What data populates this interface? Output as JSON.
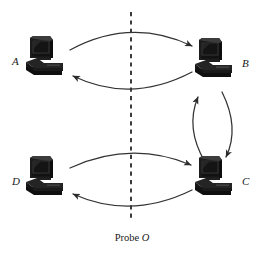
{
  "figure": {
    "caption_prefix": "Probe",
    "caption_symbol": "O",
    "width": 264,
    "height": 255,
    "background_color": "#ffffff",
    "ink_color": "#1a1a1a"
  },
  "nodes": [
    {
      "id": "A",
      "label": "A",
      "icon": "computer-workstation-icon",
      "position": "top-left",
      "label_side": "left",
      "x": 45,
      "y": 57
    },
    {
      "id": "B",
      "label": "B",
      "icon": "computer-workstation-icon",
      "position": "top-right",
      "label_side": "right",
      "x": 214,
      "y": 59
    },
    {
      "id": "C",
      "label": "C",
      "icon": "computer-workstation-icon",
      "position": "bottom-right",
      "label_side": "right",
      "x": 214,
      "y": 177
    },
    {
      "id": "D",
      "label": "D",
      "icon": "computer-workstation-icon",
      "position": "bottom-left",
      "label_side": "left",
      "x": 45,
      "y": 177
    }
  ],
  "divider": {
    "name": "vertical-dashed-divider",
    "orientation": "vertical",
    "x": 131,
    "y_start": 12,
    "y_end": 222,
    "style": "dashed",
    "dash": "4 4",
    "color": "#1a1a1a",
    "width": 1.6
  },
  "arrows": [
    {
      "id": "a-to-b",
      "from": "A",
      "to": "B",
      "curve": "arc-up",
      "crosses_divider": true
    },
    {
      "id": "b-to-a",
      "from": "B",
      "to": "A",
      "curve": "arc-down",
      "crosses_divider": true
    },
    {
      "id": "d-to-c",
      "from": "D",
      "to": "C",
      "curve": "arc-up",
      "crosses_divider": true
    },
    {
      "id": "c-to-d",
      "from": "C",
      "to": "D",
      "curve": "arc-down",
      "crosses_divider": true
    },
    {
      "id": "c-to-b",
      "from": "C",
      "to": "B",
      "curve": "arc-left",
      "crosses_divider": false
    },
    {
      "id": "b-to-c",
      "from": "B",
      "to": "C",
      "curve": "arc-right",
      "crosses_divider": false
    }
  ],
  "colors": {
    "ink": "#1a1a1a",
    "stroke": "#333333",
    "monitor_body": "#1c1c1c",
    "screen": "#2e2e2e",
    "screen_dark": "#161616",
    "base": "#242424",
    "highlight": "#4a4a4a"
  }
}
